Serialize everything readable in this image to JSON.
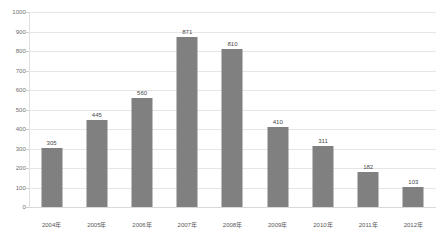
{
  "chart_data": {
    "type": "bar",
    "title": "",
    "subtitle": "",
    "xlabel": "",
    "ylabel": "",
    "categories": [
      "2004年",
      "2005年",
      "2006年",
      "2007年",
      "2008年",
      "2009年",
      "2010年",
      "2011年",
      "2012年"
    ],
    "values": [
      305,
      445,
      560,
      871,
      810,
      410,
      311,
      182,
      103
    ],
    "ylim": [
      0,
      1000
    ],
    "y_ticks": [
      0,
      100,
      200,
      300,
      400,
      500,
      600,
      700,
      800,
      900,
      1000
    ],
    "y_tick_labels": [
      "0",
      "100",
      "200",
      "300",
      "400",
      "500",
      "600",
      "700",
      "800",
      "900",
      "1000"
    ],
    "grid": true,
    "legend": false,
    "legend_position": "none",
    "data_labels": [
      "305",
      "445",
      "560",
      "871",
      "810",
      "410",
      "311",
      "182",
      "103"
    ],
    "series_color": "#808080",
    "gridline_color": "#e6e6e6",
    "background_color": "#ffffff",
    "text_color": "#595959"
  }
}
